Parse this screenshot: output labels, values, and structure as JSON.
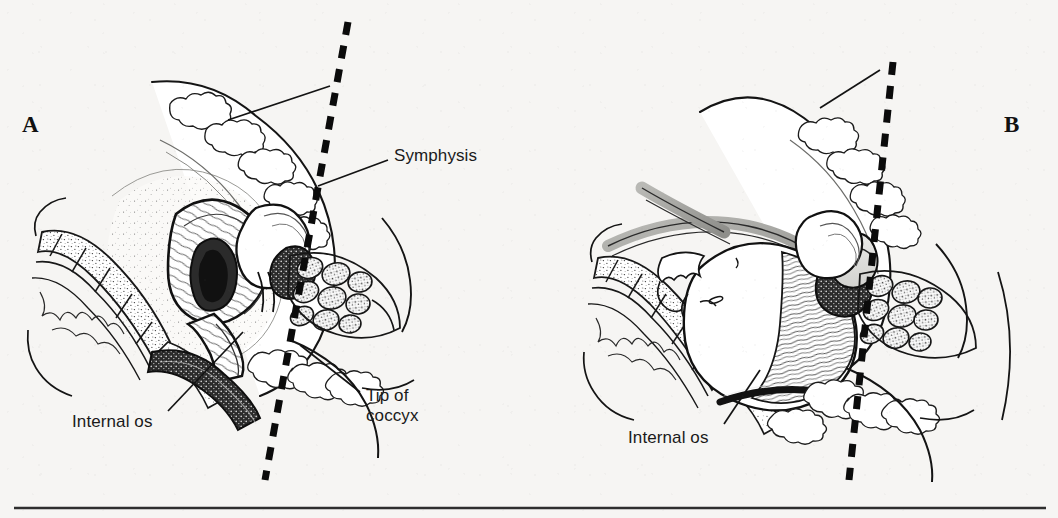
{
  "figure": {
    "type": "medical-anatomical-illustration",
    "background_color": "#f6f5f3",
    "ink_color": "#1a1a1a",
    "panels": [
      {
        "id": "A",
        "letter": "A",
        "letter_x": 22,
        "letter_y": 112,
        "subject": "Sagittal pelvis before engagement, uterus and cervix in place",
        "labels": [
          {
            "name": "symphysis",
            "text": "Symphysis",
            "x": 394,
            "y": 146,
            "leader": {
              "x1": 388,
              "y1": 160,
              "x2": 318,
              "y2": 186
            }
          },
          {
            "name": "internal-os",
            "text": "Internal os",
            "x": 72,
            "y": 412,
            "leader": {
              "x1": 168,
              "y1": 411,
              "x2": 243,
              "y2": 332
            }
          },
          {
            "name": "tip-of-coccyx",
            "text": "Tip of\ncoccyx",
            "line1": "Tip of",
            "line2": "coccyx",
            "x": 366,
            "y": 386,
            "leader": {
              "x1": 360,
              "y1": 392,
              "x2": 300,
              "y2": 345
            }
          }
        ],
        "axis_line": {
          "name": "pelvic-axis-dashed-line",
          "style": "dashed",
          "x1": 348,
          "y1": 22,
          "x2": 265,
          "y2": 480
        },
        "unlabeled_leader": {
          "x1": 330,
          "y1": 86,
          "x2": 228,
          "y2": 120
        }
      },
      {
        "id": "B",
        "letter": "B",
        "letter_x": 1004,
        "letter_y": 112,
        "subject": "Sagittal pelvis with fetal head engaged in the pelvic inlet",
        "labels": [
          {
            "name": "internal-os",
            "text": "Internal os",
            "x": 628,
            "y": 428,
            "leader": {
              "x1": 724,
              "y1": 424,
              "x2": 760,
              "y2": 370
            }
          }
        ],
        "axis_line": {
          "name": "pelvic-axis-dashed-line",
          "style": "dashed",
          "x1": 893,
          "y1": 62,
          "x2": 849,
          "y2": 480
        },
        "unlabeled_leader": {
          "x1": 880,
          "y1": 70,
          "x2": 820,
          "y2": 108
        }
      }
    ],
    "rule": {
      "name": "bottom-rule",
      "x1": 14,
      "y1": 508,
      "x2": 1046,
      "y2": 508
    }
  }
}
